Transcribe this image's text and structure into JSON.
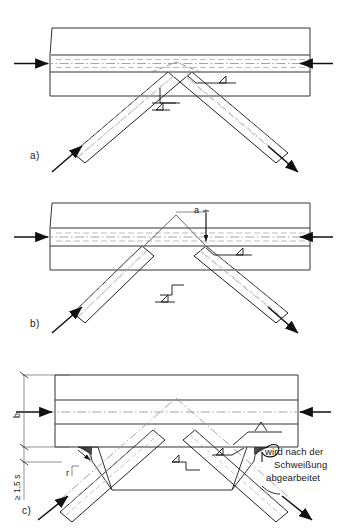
{
  "drawing": {
    "title": "Geschweisste Knotenblech-Anschluesse (Varianten a, b, c)",
    "background_color": "#ffffff",
    "line_color": "#1a1a1a",
    "center_line_color": "#8a8a8a",
    "hidden_line_color": "#9a9a9a"
  },
  "panels": [
    {
      "id": "a",
      "label": "a)",
      "description": "Diagonalen stossen direkt am Gurt zusammen",
      "weld_symbols": [
        {
          "name": "fillet-weld-right",
          "glyph": "triangle"
        },
        {
          "name": "fillet-weld-center",
          "glyph": "triangle"
        }
      ]
    },
    {
      "id": "b",
      "label": "b)",
      "description": "Diagonalen mit Abstand a zum Gurt",
      "dimensions": [
        {
          "name": "a",
          "value": "a"
        }
      ],
      "weld_symbols": [
        {
          "name": "fillet-weld-right",
          "glyph": "triangle"
        },
        {
          "name": "fillet-weld-center",
          "glyph": "triangle"
        }
      ]
    },
    {
      "id": "c",
      "label": "c)",
      "description": "Knotenblech mit Ausrundung, nach dem Schweissen bearbeitet",
      "dimensions": [
        {
          "name": "b",
          "value": "b"
        },
        {
          "name": "min-edge",
          "value": "≥ 1,5 s"
        },
        {
          "name": "radius",
          "value": "r"
        }
      ],
      "weld_symbols": [
        {
          "name": "v-weld",
          "glyph": "V"
        },
        {
          "name": "fillet-weld-right",
          "glyph": "triangle"
        },
        {
          "name": "fillet-weld-center",
          "glyph": "triangle"
        }
      ],
      "note_lines": [
        "wird nach der",
        "Schweißung",
        "abgearbeitet"
      ]
    }
  ],
  "arrows": {
    "chord_left": "force-arrow-right",
    "chord_right": "force-arrow-left",
    "diagonal_left": "force-arrow-up-right",
    "diagonal_right": "force-arrow-down-right"
  }
}
